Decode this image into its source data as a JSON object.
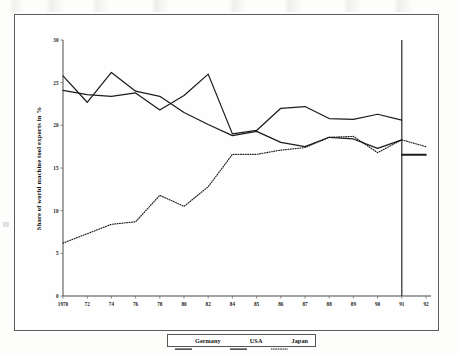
{
  "figure": {
    "border_color": "#5c5c5c",
    "background": "#fefefe"
  },
  "axis": {
    "ylabel": "Share of world machine tool exports in %",
    "yticks": [
      "0",
      "5",
      "10",
      "15",
      "20",
      "25",
      "30"
    ],
    "xticks": [
      "1970",
      "72",
      "74",
      "76",
      "78",
      "80",
      "82",
      "84",
      "85",
      "86",
      "87",
      "88",
      "89",
      "90",
      "91",
      "92"
    ]
  },
  "legend": {
    "items": [
      {
        "label": "Germany",
        "style": "solid"
      },
      {
        "label": "USA",
        "style": "solid"
      },
      {
        "label": "Japan",
        "style": "dotted"
      }
    ]
  },
  "annotations": {
    "reference_line_year": "91"
  },
  "chart_data": {
    "type": "line",
    "title": "",
    "xlabel": "",
    "ylabel": "Share of world machine tool exports in %",
    "ylim": [
      0,
      30
    ],
    "yticks": [
      0,
      5,
      10,
      15,
      20,
      25,
      30
    ],
    "grid": false,
    "legend_position": "bottom-center",
    "x": [
      "1970",
      "72",
      "74",
      "76",
      "78",
      "80",
      "82",
      "84",
      "85",
      "86",
      "87",
      "88",
      "89",
      "90",
      "91",
      "92"
    ],
    "line_color": "#1c1c1c",
    "vertical_reference_line": {
      "at": "91",
      "from": 0,
      "to": 30
    },
    "series": [
      {
        "name": "Germany",
        "style": "solid",
        "values": [
          24.1,
          23.6,
          23.4,
          23.8,
          21.8,
          23.5,
          26.0,
          19.0,
          19.4,
          22.0,
          22.2,
          20.8,
          20.7,
          21.3,
          20.6,
          20.6
        ]
      },
      {
        "name": "USA",
        "style": "solid",
        "values": [
          25.8,
          22.7,
          26.2,
          24.0,
          23.4,
          21.5,
          20.1,
          18.8,
          19.3,
          18.0,
          17.5,
          18.6,
          18.4,
          17.3,
          18.3,
          18.0
        ]
      },
      {
        "name": "Japan",
        "style": "dotted",
        "values": [
          6.2,
          7.3,
          8.4,
          8.7,
          11.8,
          10.5,
          12.8,
          16.6,
          16.6,
          17.1,
          17.4,
          18.6,
          18.7,
          16.8,
          18.3,
          17.5
        ]
      }
    ],
    "post_break_segments": [
      {
        "name": "Germany",
        "note": "discontinuity at 1991 reference line",
        "from": 20.6,
        "to": 16.6
      },
      {
        "name": "USA",
        "note": "discontinuity at 1991 reference line",
        "from": 18.3,
        "to": 16.5
      },
      {
        "name": "Japan",
        "note": "continues across 1991",
        "from": 18.3,
        "to": 17.5
      }
    ]
  }
}
